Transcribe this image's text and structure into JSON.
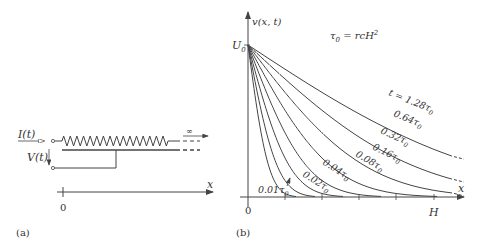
{
  "panel_a": {
    "label": "(a)",
    "current_label": "I(t)",
    "voltage_label": "V(t)",
    "infinity_label": "∞",
    "axis_label": "x",
    "origin_label": "0"
  },
  "panel_b": {
    "label": "(b)",
    "y_axis_label": "v(x, t)",
    "u0_label": "U",
    "u0_sub": "0",
    "tau_formula_main": "τ",
    "tau_formula_sub": "0",
    "tau_formula_rest": " = rcH",
    "tau_formula_sup": "2",
    "x_axis_label": "x",
    "origin_label": "0",
    "h_label": "H"
  },
  "chart_data": {
    "type": "line",
    "title": "",
    "xlabel": "x",
    "ylabel": "v(x, t)",
    "x_ticks": [
      "0",
      "",
      "",
      "",
      "H"
    ],
    "y_ticks": [
      "U0"
    ],
    "annotation": "τ0 = rcH²",
    "series": [
      {
        "name": "t = 1.28τ0",
        "t": 1.28
      },
      {
        "name": "0.64τ0",
        "t": 0.64
      },
      {
        "name": "0.32τ0",
        "t": 0.32
      },
      {
        "name": "0.16τ0",
        "t": 0.16
      },
      {
        "name": "0.08τ0",
        "t": 0.08
      },
      {
        "name": "0.04τ0",
        "t": 0.04
      },
      {
        "name": "0.02τ0",
        "t": 0.02
      },
      {
        "name": "0.01τ0",
        "t": 0.01
      }
    ],
    "grid": false,
    "legend": "inline labels"
  }
}
